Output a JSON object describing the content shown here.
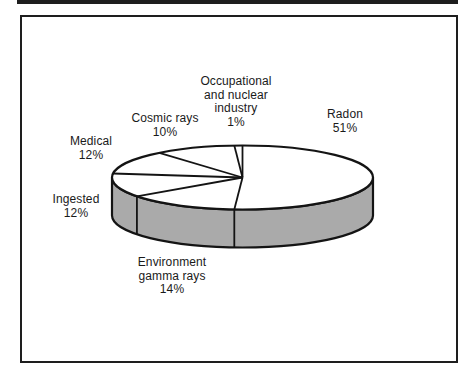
{
  "decorations": {
    "top_rule_color": "#1e1e1e",
    "frame_border_color": "#1e1e1e"
  },
  "chart_data": {
    "type": "pie",
    "style": "3d",
    "title": "",
    "legend": "none",
    "start": "top",
    "direction": "clockwise",
    "categories": [
      "Radon",
      "Environment gamma rays",
      "Ingested",
      "Medical",
      "Cosmic rays",
      "Occupational and nuclear industry"
    ],
    "values": [
      51,
      14,
      12,
      12,
      10,
      1
    ],
    "unit": "%",
    "data_labels": [
      "Radon 51%",
      "Environment gamma rays 14%",
      "Ingested 12%",
      "Medical 12%",
      "Cosmic rays 10%",
      "Occupational and nuclear industry 1%"
    ],
    "top_fill": "#ffffff",
    "side_fill": "#aaaaaa",
    "outline_color": "#141414"
  },
  "labels": {
    "occupational": {
      "line1": "Occupational",
      "line2": "and nuclear",
      "line3": "industry",
      "line4": "1%"
    },
    "radon": {
      "line1": "Radon",
      "line2": "51%"
    },
    "cosmic": {
      "line1": "Cosmic rays",
      "line2": "10%"
    },
    "medical": {
      "line1": "Medical",
      "line2": "12%"
    },
    "ingested": {
      "line1": "Ingested",
      "line2": "12%"
    },
    "environment": {
      "line1": "Environment",
      "line2": "gamma rays",
      "line3": "14%"
    }
  }
}
